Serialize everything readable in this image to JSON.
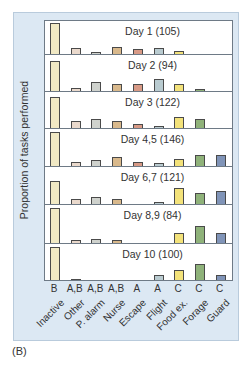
{
  "chart_data": {
    "type": "bar",
    "title": "",
    "ylabel": "Proportion of tasks performed",
    "xlabel": "",
    "panel_label": "(B)",
    "categories": [
      "Inactive",
      "Other",
      "P. alarm",
      "Nurse",
      "Escape",
      "Flight",
      "Food ex.",
      "Forage",
      "Guard"
    ],
    "significance_letters": [
      "B",
      "A,B",
      "A,B",
      "A,B",
      "A",
      "A",
      "C",
      "C",
      "C"
    ],
    "colors": [
      "#f1e9c4",
      "#ead9cc",
      "#cfd2cd",
      "#d9b98c",
      "#d89a86",
      "#b9cbd0",
      "#f3e27a",
      "#8fb27a",
      "#8094b8"
    ],
    "grid": false,
    "series": [
      {
        "name": "Day 1 (105)",
        "values": [
          0.43,
          0.08,
          0.03,
          0.1,
          0.07,
          0.08,
          0.04,
          0.0,
          0.0
        ]
      },
      {
        "name": "Day 2 (94)",
        "values": [
          0.42,
          0.04,
          0.12,
          0.1,
          0.1,
          0.17,
          0.1,
          0.03,
          0.0
        ]
      },
      {
        "name": "Day 3 (122)",
        "values": [
          0.43,
          0.1,
          0.12,
          0.1,
          0.06,
          0.03,
          0.15,
          0.12,
          0.0
        ]
      },
      {
        "name": "Day 4,5 (146)",
        "values": [
          0.47,
          0.06,
          0.08,
          0.12,
          0.06,
          0.04,
          0.1,
          0.15,
          0.15
        ]
      },
      {
        "name": "Day 6,7 (121)",
        "values": [
          0.32,
          0.07,
          0.1,
          0.07,
          0.0,
          0.03,
          0.22,
          0.15,
          0.18
        ]
      },
      {
        "name": "Day 8,9 (84)",
        "values": [
          0.49,
          0.04,
          0.06,
          0.04,
          0.0,
          0.0,
          0.14,
          0.24,
          0.14
        ]
      },
      {
        "name": "Day 10 (100)",
        "values": [
          0.46,
          0.01,
          0.0,
          0.0,
          0.0,
          0.07,
          0.14,
          0.22,
          0.07
        ]
      }
    ]
  }
}
